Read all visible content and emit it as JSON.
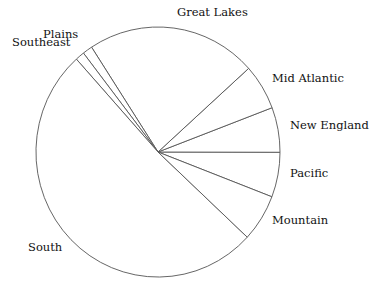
{
  "chart_data": {
    "type": "pie",
    "title": "",
    "categories": [
      "Pacific",
      "New England",
      "Mid Atlantic",
      "Great Lakes",
      "Plains",
      "Southeast",
      "South",
      "Mountain"
    ],
    "values": [
      5.8,
      5.8,
      5.9,
      22.5,
      1.3,
      1.2,
      51.4,
      6.1
    ],
    "unit": "percent (estimated from slice angles)",
    "start_angle_deg": -21,
    "direction": "counterclockwise",
    "legend": "none (labels placed outside slices)",
    "fill_color": "#ffffff",
    "stroke_color": "#555555"
  },
  "geometry": {
    "cx": 158,
    "cy": 152,
    "rx": 122,
    "ry": 125
  },
  "labels": [
    {
      "text": "Great Lakes",
      "x": 177,
      "y": 16,
      "anchor": "start"
    },
    {
      "text": "Mid Atlantic",
      "x": 272,
      "y": 82,
      "anchor": "start"
    },
    {
      "text": "New England",
      "x": 290,
      "y": 129,
      "anchor": "start"
    },
    {
      "text": "Pacific",
      "x": 290,
      "y": 177,
      "anchor": "start"
    },
    {
      "text": "Mountain",
      "x": 272,
      "y": 224,
      "anchor": "start"
    },
    {
      "text": "South",
      "x": 28,
      "y": 251,
      "anchor": "start"
    },
    {
      "text": "Southeast",
      "x": 12,
      "y": 46,
      "anchor": "start"
    },
    {
      "text": "Plains",
      "x": 43,
      "y": 38,
      "anchor": "start"
    }
  ]
}
